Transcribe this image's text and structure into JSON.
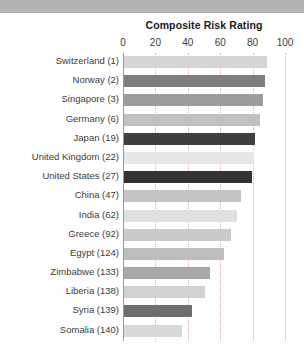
{
  "chart_data": {
    "type": "bar",
    "orientation": "horizontal",
    "title": "Composite Risk Rating",
    "xlabel": "",
    "ylabel": "",
    "xlim": [
      0,
      100
    ],
    "xticks": [
      0,
      20,
      40,
      60,
      80,
      100
    ],
    "grid": true,
    "legend": "none",
    "categories": [
      "Switzerland (1)",
      "Norway (2)",
      "Singapore (3)",
      "Germany (6)",
      "Japan (19)",
      "United Kingdom (22)",
      "United States (27)",
      "China (47)",
      "India (62)",
      "Greece (92)",
      "Egypt (124)",
      "Zimbabwe (133)",
      "Liberia (138)",
      "Syria (139)",
      "Somalia (140)"
    ],
    "values": [
      88,
      87,
      86,
      84,
      81,
      80,
      79,
      72,
      70,
      66,
      62,
      53,
      50,
      42,
      36
    ],
    "bar_colors": [
      "#d5d5d5",
      "#7d7d7d",
      "#9c9c9c",
      "#c0c0c0",
      "#3f3f3f",
      "#e6e6e6",
      "#333333",
      "#c4c4c4",
      "#e0e0e0",
      "#c9c9c9",
      "#bdbdbd",
      "#a8a8a8",
      "#d2d2d2",
      "#6e6e6e",
      "#d8d8d8"
    ]
  },
  "decor": {
    "band_color": "#b4b4b4",
    "band_line_color": "#ffffff"
  },
  "style": {
    "axis_color": "#9a9a9a",
    "gridline_color": "#d9b3b3",
    "text_color": "#3c3c3c",
    "title_color": "#1a1a1a"
  }
}
